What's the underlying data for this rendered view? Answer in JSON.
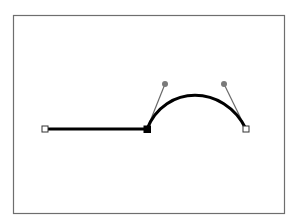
{
  "diagram": {
    "type": "bezier-path-editor",
    "frame": {
      "x": 13.5,
      "y": 15.5,
      "width": 271,
      "height": 198,
      "stroke": "#6e6e6e",
      "fill": "#ffffff"
    },
    "path": {
      "stroke": "#000000",
      "stroke_width": 3,
      "segments": [
        {
          "kind": "line",
          "from": [
            45,
            129
          ],
          "to": [
            147,
            129
          ]
        },
        {
          "kind": "cubic",
          "from": [
            147,
            129
          ],
          "c1": [
            165,
            84
          ],
          "c2": [
            224,
            84
          ],
          "to": [
            246,
            129
          ]
        }
      ]
    },
    "anchors": [
      {
        "id": "anchor-start",
        "x": 45,
        "y": 129,
        "selected": false
      },
      {
        "id": "anchor-middle",
        "x": 147,
        "y": 129,
        "selected": true
      },
      {
        "id": "anchor-end",
        "x": 246,
        "y": 129,
        "selected": false
      }
    ],
    "handles": [
      {
        "id": "handle-1",
        "from": [
          147,
          129
        ],
        "to": [
          165,
          84
        ]
      },
      {
        "id": "handle-2",
        "from": [
          246,
          129
        ],
        "to": [
          224,
          84
        ]
      }
    ],
    "colors": {
      "handle_line": "#6a6a6a",
      "handle_dot": "#7a7a7a",
      "anchor_open_fill": "#ffffff",
      "anchor_open_stroke": "#333333",
      "anchor_selected_fill": "#000000"
    }
  }
}
